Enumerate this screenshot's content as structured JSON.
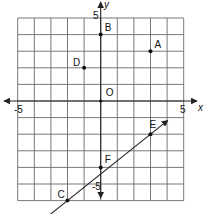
{
  "chart_data": {
    "type": "scatter",
    "title": "",
    "xlabel": "x",
    "ylabel": "y",
    "xlim": [
      -5,
      5
    ],
    "ylim": [
      -6,
      5
    ],
    "grid": true,
    "tick_labels": {
      "x": [
        {
          "value": -5,
          "label": "-5"
        },
        {
          "value": 5,
          "label": "5"
        }
      ],
      "y": [
        {
          "value": 5,
          "label": "5"
        },
        {
          "value": -5,
          "label": "-5"
        }
      ]
    },
    "points": [
      {
        "label": "A",
        "x": 3,
        "y": 3
      },
      {
        "label": "B",
        "x": 0,
        "y": 4
      },
      {
        "label": "C",
        "x": -2,
        "y": -6
      },
      {
        "label": "D",
        "x": -1,
        "y": 2
      },
      {
        "label": "E",
        "x": 3,
        "y": -2
      },
      {
        "label": "F",
        "x": 0,
        "y": -4
      },
      {
        "label": "O",
        "x": 0,
        "y": 0
      }
    ],
    "lines": [
      {
        "through": [
          "C",
          "E"
        ],
        "slope": 0.8,
        "intercept": -4.4,
        "arrow_end": [
          4.04,
          -1.17
        ],
        "start": [
          -3.04,
          -6.83
        ]
      }
    ]
  },
  "labels": {
    "x_axis": "x",
    "y_axis": "y",
    "x_min": "-5",
    "x_max": "5",
    "y_max": "5",
    "y_min": "-5",
    "A": "A",
    "B": "B",
    "C": "C",
    "D": "D",
    "E": "E",
    "F": "F",
    "O": "O"
  },
  "colors": {
    "grid": "#6a6a6a",
    "axis": "#222222",
    "point": "#111111",
    "background": "#ffffff"
  }
}
